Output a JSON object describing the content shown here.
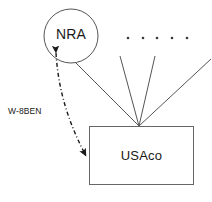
{
  "diagram": {
    "type": "flow-diagram",
    "background_color": "#ffffff",
    "stroke_color": "#555555",
    "dash_stroke_color": "#1a1a1a",
    "text_color": "#1a1a1a",
    "nodes": [
      {
        "id": "nra",
        "shape": "circle",
        "label": "NRA",
        "cx": 71,
        "cy": 36,
        "r": 27
      },
      {
        "id": "usaco",
        "shape": "rectangle",
        "label": "USAco",
        "x": 89,
        "y": 126,
        "width": 105,
        "height": 59
      }
    ],
    "edges": [
      {
        "id": "nra-to-usaco-solid",
        "style": "solid",
        "from": "nra",
        "to": "usaco",
        "arrow": false,
        "label": ""
      },
      {
        "id": "usaco-to-nra-dashdot",
        "style": "dash-dot",
        "from": "usaco",
        "to": "nra",
        "arrow": "both",
        "label": "W-8BEN"
      },
      {
        "id": "owner-line-2",
        "style": "solid",
        "from": "other-owner",
        "to": "usaco",
        "arrow": false,
        "label": ""
      },
      {
        "id": "owner-line-3",
        "style": "solid",
        "from": "other-owner",
        "to": "usaco",
        "arrow": false,
        "label": ""
      },
      {
        "id": "owner-line-4",
        "style": "solid",
        "from": "other-owner",
        "to": "usaco",
        "arrow": false,
        "label": ""
      }
    ],
    "ellipsis": {
      "id": "other-owners-ellipsis",
      "dot_count": 5,
      "y": 38,
      "x_positions": [
        128,
        143,
        157,
        172,
        187
      ]
    },
    "edge_label": "W-8BEN"
  }
}
